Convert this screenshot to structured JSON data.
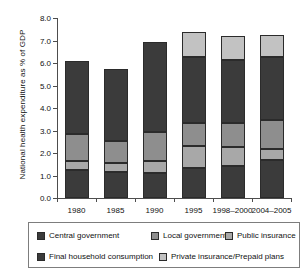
{
  "chart_data": {
    "type": "bar",
    "subtype": "stacked-vertical",
    "title": "",
    "xlabel": "",
    "ylabel": "National health expenditure as % of GDP",
    "ylim": [
      0.0,
      8.0
    ],
    "ytick_step": 1.0,
    "ytick_labels": [
      "0.0",
      "1.0",
      "2.0",
      "3.0",
      "4.0",
      "5.0",
      "6.0",
      "7.0",
      "8.0"
    ],
    "grid": false,
    "legend_position": "bottom",
    "categories": [
      "1980",
      "1985",
      "1990",
      "1995",
      "1998–2000",
      "2004–2005"
    ],
    "stack_order_bottom_to_top": [
      "Final household consumption",
      "Public insurance",
      "Local government",
      "Central government",
      "Private insurance/Prepaid plans"
    ],
    "series": [
      {
        "name": "Final household consumption",
        "color": "#3b3b3b",
        "values": [
          1.25,
          1.15,
          1.1,
          1.35,
          1.42,
          1.68
        ]
      },
      {
        "name": "Public insurance",
        "color": "#a8a8a8",
        "values": [
          0.4,
          0.42,
          0.55,
          0.95,
          0.85,
          0.52
        ]
      },
      {
        "name": "Local government",
        "color": "#8e8e8e",
        "values": [
          1.2,
          0.95,
          1.3,
          1.05,
          1.05,
          1.28
        ]
      },
      {
        "name": "Central government",
        "color": "#3b3b3b",
        "values": [
          3.25,
          3.2,
          3.97,
          2.9,
          2.8,
          2.77
        ]
      },
      {
        "name": "Private insurance/Prepaid plans",
        "color": "#c2c2c2",
        "values": [
          0.0,
          0.0,
          0.0,
          1.15,
          1.1,
          1.0
        ]
      }
    ],
    "totals": [
      6.1,
      5.72,
      6.92,
      7.4,
      7.22,
      7.25
    ]
  },
  "legend": {
    "rows": [
      [
        {
          "label": "Central government",
          "color": "#3b3b3b"
        },
        {
          "label": "Local government",
          "color": "#8e8e8e"
        },
        {
          "label": "Public insurance",
          "color": "#a8a8a8"
        }
      ],
      [
        {
          "label": "Final household consumption",
          "color": "#3b3b3b"
        },
        {
          "label": "Private insurance/Prepaid plans",
          "color": "#c2c2c2"
        }
      ]
    ]
  }
}
